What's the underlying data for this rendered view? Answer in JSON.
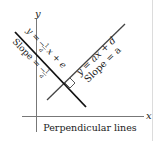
{
  "diagram": {
    "axis_x_label": "x",
    "axis_y_label": "y",
    "line1": {
      "equation": "y = ax + d",
      "slope_label": "Slope = a"
    },
    "line2": {
      "equation": "y = -1/a x + e",
      "eq_prefix": "y =",
      "eq_frac_num": "1",
      "eq_frac_den": "a",
      "eq_suffix": "x + e",
      "eq_minus": "−",
      "slope_prefix": "Slope =",
      "slope_minus": "−",
      "slope_frac_num": "1",
      "slope_frac_den": "a"
    },
    "caption": "Perpendicular lines",
    "colors": {
      "axes": "#777777",
      "line1": "#444444",
      "line2": "#111111",
      "border": "#d8d8d8"
    }
  }
}
